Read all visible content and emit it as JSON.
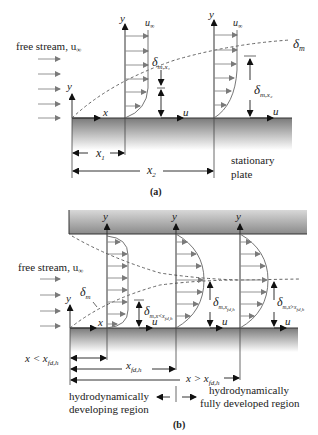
{
  "panel_a": {
    "caption": "(a)",
    "free_stream_label": "free stream, u",
    "free_stream_sub": "∞",
    "axis_y": "y",
    "axis_x": "x",
    "u_label": "u",
    "u_inf_label": "u",
    "u_inf_sub": "∞",
    "delta_m_label": "δ",
    "delta_m_sub": "m",
    "delta_x1_label": "δ",
    "delta_x1_sub": "m,x₁",
    "delta_x2_label": "δ",
    "delta_x2_sub": "m,x₂",
    "x1_label": "x",
    "x1_sub": "1",
    "x2_label": "x",
    "x2_sub": "2",
    "plate_label_1": "stationary",
    "plate_label_2": "plate"
  },
  "panel_b": {
    "caption": "(b)",
    "free_stream_label": "free stream, u",
    "free_stream_sub": "∞",
    "axis_y": "y",
    "axis_x": "x",
    "u_label": "u",
    "delta_m_label": "δ",
    "delta_m_sub": "m",
    "delta_dev_label": "δ",
    "delta_dev_sub": "m,x<x",
    "delta_dev_subsub": "fd,h",
    "delta_fd_label": "δ",
    "delta_fd_sub": "m,x",
    "delta_fd_subsub": "fd,h",
    "delta_after_label": "δ",
    "delta_after_sub": "m,x>x",
    "delta_after_subsub": "fd,h",
    "dim_lt_label": "x < x",
    "dim_lt_sub": "fd,h",
    "dim_fd_label": "x",
    "dim_fd_sub": "fd,h",
    "dim_gt_label": "x > x",
    "dim_gt_sub": "fd,h",
    "region_dev_1": "hydrodynamically",
    "region_dev_2": "developing region",
    "region_fd_1": "hydrodynamically",
    "region_fd_2": "fully developed region"
  },
  "colors": {
    "plate_top": "#7f7f7f",
    "plate_bottom": "#ffffff",
    "arrow_fill": "#7a7a7a",
    "line": "#333333"
  }
}
